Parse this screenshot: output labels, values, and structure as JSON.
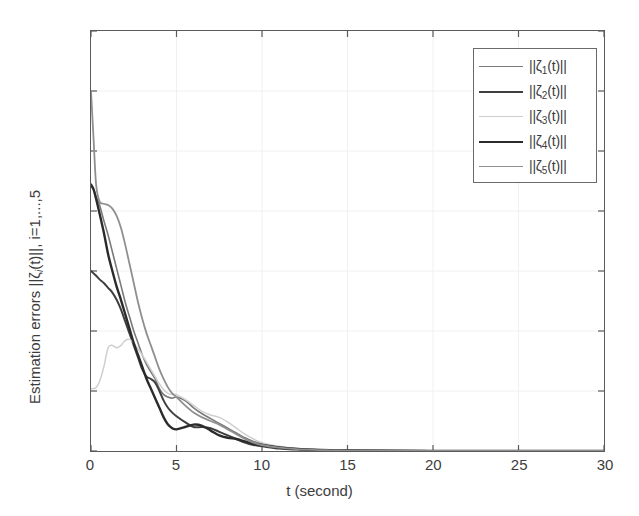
{
  "chart_data": {
    "type": "line",
    "title": "",
    "xlabel": "t (second)",
    "ylabel": "Estimation errors ||ζi(t)||, i=1,...,5",
    "xlim": [
      0,
      30
    ],
    "ylim": [
      0,
      3.5
    ],
    "xticks": [
      "0",
      "5",
      "10",
      "15",
      "20",
      "25",
      "30"
    ],
    "yticks": [
      "0",
      "0.5",
      "1",
      "1.5",
      "2",
      "2.5",
      "3",
      "3.5"
    ],
    "grid": true,
    "legend_position": "top-right",
    "x": [
      0,
      0.15,
      0.3,
      0.5,
      0.75,
      1,
      1.25,
      1.5,
      1.75,
      2,
      2.25,
      2.5,
      2.75,
      3,
      3.25,
      3.5,
      3.75,
      4,
      4.25,
      4.5,
      4.75,
      5,
      5.5,
      6,
      6.5,
      7,
      7.5,
      8,
      8.5,
      9,
      9.5,
      10,
      11,
      12,
      13,
      14,
      15,
      17,
      20,
      25,
      30
    ],
    "series": [
      {
        "name": "||ζ1(t)||",
        "label_main": "||ζ",
        "label_sub": "1",
        "label_tail": "(t)||",
        "color": "#7a7a7a",
        "width": 1.6,
        "values": [
          2.2,
          2.18,
          2.12,
          2.05,
          1.92,
          1.8,
          1.66,
          1.52,
          1.38,
          1.24,
          1.12,
          1.0,
          0.9,
          0.8,
          0.72,
          0.66,
          0.6,
          0.52,
          0.47,
          0.45,
          0.44,
          0.45,
          0.42,
          0.36,
          0.31,
          0.27,
          0.23,
          0.19,
          0.15,
          0.11,
          0.08,
          0.06,
          0.035,
          0.02,
          0.012,
          0.008,
          0.005,
          0.003,
          0.002,
          0.001,
          0.001
        ]
      },
      {
        "name": "||ζ2(t)||",
        "label_main": "||ζ",
        "label_sub": "2",
        "label_tail": "(t)||",
        "color": "#3f3f3f",
        "width": 2.0,
        "values": [
          1.5,
          1.48,
          1.46,
          1.43,
          1.4,
          1.36,
          1.32,
          1.26,
          1.18,
          1.08,
          0.98,
          0.88,
          0.78,
          0.68,
          0.62,
          0.6,
          0.57,
          0.5,
          0.42,
          0.36,
          0.32,
          0.29,
          0.24,
          0.2,
          0.2,
          0.19,
          0.16,
          0.13,
          0.1,
          0.07,
          0.05,
          0.04,
          0.02,
          0.012,
          0.008,
          0.005,
          0.003,
          0.002,
          0.001,
          0.001,
          0.001
        ]
      },
      {
        "name": "||ζ3(t)||",
        "label_main": "||ζ",
        "label_sub": "3",
        "label_tail": "(t)||",
        "color": "#cfcfcf",
        "width": 1.5,
        "values": [
          0.52,
          0.52,
          0.53,
          0.58,
          0.7,
          0.86,
          0.88,
          0.86,
          0.88,
          0.92,
          0.93,
          0.9,
          0.85,
          0.8,
          0.74,
          0.68,
          0.62,
          0.56,
          0.51,
          0.48,
          0.47,
          0.47,
          0.43,
          0.38,
          0.33,
          0.3,
          0.28,
          0.24,
          0.19,
          0.14,
          0.1,
          0.07,
          0.04,
          0.022,
          0.013,
          0.008,
          0.005,
          0.003,
          0.002,
          0.001,
          0.001
        ]
      },
      {
        "name": "||ζ4(t)||",
        "label_main": "||ζ",
        "label_sub": "4",
        "label_tail": "(t)||",
        "color": "#2b2b2b",
        "width": 2.4,
        "values": [
          2.22,
          2.18,
          2.1,
          1.98,
          1.82,
          1.64,
          1.5,
          1.37,
          1.26,
          1.14,
          1.02,
          0.9,
          0.8,
          0.7,
          0.6,
          0.52,
          0.44,
          0.36,
          0.28,
          0.22,
          0.19,
          0.18,
          0.2,
          0.22,
          0.21,
          0.17,
          0.13,
          0.11,
          0.1,
          0.08,
          0.06,
          0.05,
          0.03,
          0.018,
          0.01,
          0.006,
          0.004,
          0.002,
          0.001,
          0.001,
          0.001
        ]
      },
      {
        "name": "||ζ5(t)||",
        "label_main": "||ζ",
        "label_sub": "5",
        "label_tail": "(t)||",
        "color": "#8f8f8f",
        "width": 1.8,
        "values": [
          3.0,
          2.6,
          2.22,
          2.08,
          2.06,
          2.05,
          2.02,
          1.96,
          1.86,
          1.72,
          1.56,
          1.4,
          1.24,
          1.1,
          0.98,
          0.88,
          0.78,
          0.68,
          0.6,
          0.53,
          0.48,
          0.45,
          0.38,
          0.32,
          0.28,
          0.25,
          0.22,
          0.18,
          0.14,
          0.1,
          0.07,
          0.05,
          0.028,
          0.016,
          0.009,
          0.006,
          0.004,
          0.002,
          0.001,
          0.001,
          0.001
        ]
      }
    ]
  },
  "legend": {
    "items": [
      {
        "label": "||ζ1(t)||"
      },
      {
        "label": "||ζ2(t)||"
      },
      {
        "label": "||ζ3(t)||"
      },
      {
        "label": "||ζ4(t)||"
      },
      {
        "label": "||ζ5(t)||"
      }
    ]
  },
  "axis": {
    "ylabel_prefix": "Estimation errors ||ζ",
    "ylabel_sub": "i",
    "ylabel_suffix": "(t)||, i=1,...,5",
    "xlabel": "t (second)"
  }
}
